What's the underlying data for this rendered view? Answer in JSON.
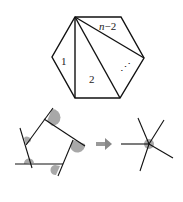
{
  "hexagon": {
    "labels": {
      "triangle1": "1",
      "triangle2": "2",
      "ellipsis": "⋰",
      "last_n": "n",
      "last_rest": "−2"
    }
  },
  "pentagon_exterior_angles": {
    "angle_fill": "#999999",
    "arrow_color": "#888888"
  },
  "colors": {
    "stroke": "#111111",
    "background": "#ffffff"
  }
}
